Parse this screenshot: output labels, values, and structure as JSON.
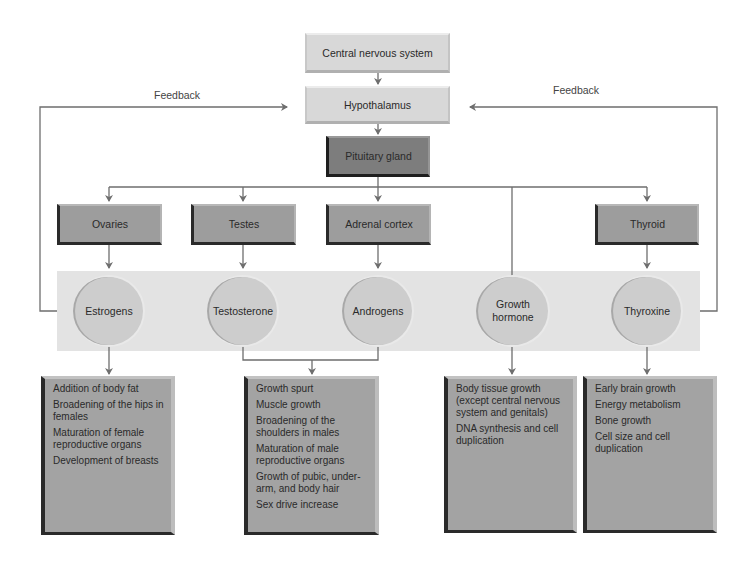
{
  "top": {
    "cns": "Central nervous system",
    "hypothalamus": "Hypothalamus",
    "pituitary": "Pituitary gland"
  },
  "feedback": {
    "left": "Feedback",
    "right": "Feedback"
  },
  "glands": [
    {
      "label": "Ovaries"
    },
    {
      "label": "Testes"
    },
    {
      "label": "Adrenal cortex"
    },
    {
      "label": "Thyroid"
    }
  ],
  "hormones": [
    {
      "label": "Estrogens"
    },
    {
      "label": "Testosterone"
    },
    {
      "label": "Androgens"
    },
    {
      "label": "Growth hormone"
    },
    {
      "label": "Thyroxine"
    }
  ],
  "effects": [
    {
      "items": [
        "Addition of body fat",
        "Broadening of the hips in females",
        "Maturation of female reproductive organs",
        "Development of breasts"
      ]
    },
    {
      "items": [
        "Growth spurt",
        "Muscle growth",
        "Broadening of the shoulders in males",
        "Maturation of male reproductive organs",
        "Growth of pubic, under-arm, and body hair",
        "Sex drive increase"
      ]
    },
    {
      "items": [
        "Body tissue growth (except central nervous system and genitals)",
        "DNA synthesis and cell duplication"
      ]
    },
    {
      "items": [
        "Early brain growth",
        "Energy metabolism",
        "Bone growth",
        "Cell size and cell duplication"
      ]
    }
  ],
  "colors": {
    "light_box": "#d8d8d8",
    "gland_box": "#9d9d9d",
    "pituitary_box": "#7d7d7d",
    "hormone_band": "#e3e3e3",
    "hormone_circle": "#cdcdcd",
    "effect_box": "#a3a3a3",
    "line": "#6e6e6e"
  }
}
